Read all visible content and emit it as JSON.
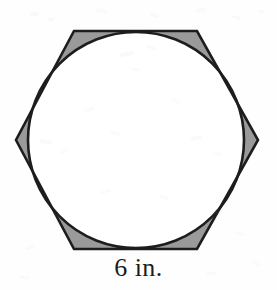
{
  "figure": {
    "kind": "geometry-diagram",
    "side_label": "6 in.",
    "colors": {
      "background": "#fefefe",
      "outline": "#1d1d1d",
      "shaded_region": "#9a9a9a",
      "inner_fill": "#ffffff",
      "label_text": "#1b1b1b"
    },
    "stroke_width": 2.6,
    "hexagon": {
      "name": "regular-hexagon",
      "orientation": "flat-top",
      "side_length_value": 6,
      "side_length_unit": "in.",
      "vertices": [
        {
          "x": 74,
          "y": 31
        },
        {
          "x": 197,
          "y": 31
        },
        {
          "x": 258,
          "y": 140
        },
        {
          "x": 197,
          "y": 249
        },
        {
          "x": 74,
          "y": 249
        },
        {
          "x": 16,
          "y": 140
        }
      ]
    },
    "circle": {
      "name": "inscribed-circle",
      "center": {
        "x": 136,
        "y": 140
      },
      "radius": 108
    },
    "shaded_corners": 6
  },
  "noise": {
    "specks": [
      {
        "x": 30,
        "y": 12,
        "w": 9,
        "h": 4,
        "r": 11,
        "o": 0.1
      },
      {
        "x": 48,
        "y": 18,
        "w": 7,
        "h": 3,
        "r": -22,
        "o": 0.09
      },
      {
        "x": 96,
        "y": 9,
        "w": 11,
        "h": 4,
        "r": 6,
        "o": 0.08
      },
      {
        "x": 150,
        "y": 14,
        "w": 8,
        "h": 3,
        "r": 30,
        "o": 0.09
      },
      {
        "x": 196,
        "y": 8,
        "w": 10,
        "h": 4,
        "r": -14,
        "o": 0.08
      },
      {
        "x": 232,
        "y": 16,
        "w": 9,
        "h": 3,
        "r": 18,
        "o": 0.09
      },
      {
        "x": 258,
        "y": 10,
        "w": 7,
        "h": 3,
        "r": -8,
        "o": 0.08
      },
      {
        "x": 120,
        "y": 52,
        "w": 14,
        "h": 4,
        "r": -12,
        "o": 0.1
      },
      {
        "x": 146,
        "y": 46,
        "w": 10,
        "h": 3,
        "r": 22,
        "o": 0.09
      },
      {
        "x": 132,
        "y": 68,
        "w": 9,
        "h": 3,
        "r": 4,
        "o": 0.08
      },
      {
        "x": 84,
        "y": 108,
        "w": 11,
        "h": 3,
        "r": -18,
        "o": 0.08
      },
      {
        "x": 172,
        "y": 100,
        "w": 9,
        "h": 3,
        "r": 26,
        "o": 0.08
      },
      {
        "x": 40,
        "y": 140,
        "w": 12,
        "h": 4,
        "r": 8,
        "o": 0.09
      },
      {
        "x": 60,
        "y": 150,
        "w": 8,
        "h": 3,
        "r": -26,
        "o": 0.08
      },
      {
        "x": 110,
        "y": 132,
        "w": 10,
        "h": 3,
        "r": 14,
        "o": 0.07
      },
      {
        "x": 190,
        "y": 136,
        "w": 13,
        "h": 4,
        "r": -10,
        "o": 0.09
      },
      {
        "x": 214,
        "y": 152,
        "w": 8,
        "h": 3,
        "r": 20,
        "o": 0.08
      },
      {
        "x": 100,
        "y": 190,
        "w": 11,
        "h": 3,
        "r": -16,
        "o": 0.08
      },
      {
        "x": 160,
        "y": 196,
        "w": 9,
        "h": 3,
        "r": 12,
        "o": 0.08
      },
      {
        "x": 52,
        "y": 214,
        "w": 10,
        "h": 3,
        "r": 24,
        "o": 0.08
      },
      {
        "x": 210,
        "y": 210,
        "w": 12,
        "h": 4,
        "r": -6,
        "o": 0.09
      },
      {
        "x": 236,
        "y": 232,
        "w": 9,
        "h": 3,
        "r": 16,
        "o": 0.08
      },
      {
        "x": 26,
        "y": 246,
        "w": 8,
        "h": 3,
        "r": -20,
        "o": 0.08
      },
      {
        "x": 20,
        "y": 276,
        "w": 10,
        "h": 3,
        "r": 10,
        "o": 0.07
      },
      {
        "x": 206,
        "y": 272,
        "w": 11,
        "h": 3,
        "r": -12,
        "o": 0.08
      },
      {
        "x": 252,
        "y": 262,
        "w": 8,
        "h": 3,
        "r": 28,
        "o": 0.07
      }
    ]
  }
}
